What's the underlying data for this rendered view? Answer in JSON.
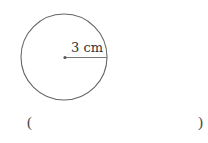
{
  "diagram": {
    "shape": "circle",
    "center": {
      "x": 64,
      "y": 57
    },
    "radius_px": 43,
    "radius_label": "3 cm",
    "stroke_color": "#666666",
    "radius_line_color": "#777777"
  },
  "answer": {
    "open_paren": "(",
    "close_paren": ")",
    "value": ""
  }
}
